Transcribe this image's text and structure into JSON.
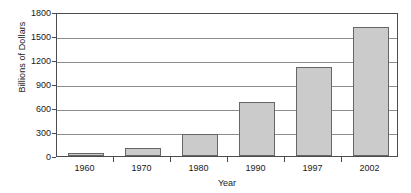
{
  "chart_data": {
    "type": "bar",
    "title": "",
    "xlabel": "Year",
    "ylabel": "Billions of Dollars",
    "categories": [
      "1960",
      "1970",
      "1980",
      "1990",
      "1997",
      "2002"
    ],
    "values": [
      40,
      100,
      270,
      680,
      1110,
      1610
    ],
    "ylim": [
      0,
      1800
    ],
    "yticks": [
      "0",
      "300",
      "600",
      "900",
      "1200",
      "1500",
      "1800"
    ],
    "ytick_values": [
      0,
      300,
      600,
      900,
      1200,
      1500,
      1800
    ],
    "grid": true,
    "legend": null,
    "bar_fill_color": "#cbcbcb",
    "bar_border_color": "#666666",
    "axis_color": "#4d4d4d",
    "grid_color": "#8c8c8c"
  }
}
